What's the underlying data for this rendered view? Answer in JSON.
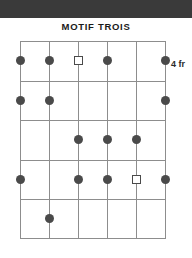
{
  "header": {
    "band_color": "#3a3a3a"
  },
  "title": "MOTIF TROIS",
  "fret_label": "4 fr",
  "chart_data": {
    "type": "table",
    "title": "MOTIF TROIS",
    "subtitle": "",
    "xlabel": "strings",
    "ylabel": "frets",
    "grid": true,
    "strings": 6,
    "frets": 5,
    "starting_fret": 4,
    "starting_fret_label": "4 fr",
    "string_x": [
      0,
      29,
      58,
      87,
      116,
      145
    ],
    "fret_y": [
      0,
      39.5,
      79,
      118.5,
      158,
      197
    ],
    "marker_colors": {
      "filled": "#4a4a4a",
      "open": "#ffffff",
      "outline": "#4a4a4a",
      "grid_line": "#8d8d8d"
    },
    "categories": [
      "string 1",
      "string 2",
      "string 3",
      "string 4",
      "string 5",
      "string 6"
    ],
    "series": [
      {
        "name": "fret 4 (row 1)",
        "values": [
          "dot",
          "dot",
          "square",
          "dot",
          "",
          "dot"
        ]
      },
      {
        "name": "fret 5 (row 2)",
        "values": [
          "dot",
          "dot",
          "",
          "",
          "",
          "dot"
        ]
      },
      {
        "name": "fret 6 (row 3)",
        "values": [
          "",
          "",
          "dot",
          "dot",
          "dot",
          ""
        ]
      },
      {
        "name": "fret 7 (row 4)",
        "values": [
          "dot",
          "",
          "dot",
          "dot",
          "square",
          "dot"
        ]
      },
      {
        "name": "fret 8 (row 5)",
        "values": [
          "",
          "dot",
          "",
          "",
          "",
          ""
        ]
      }
    ],
    "markers": [
      {
        "string": 1,
        "fret_row": 1,
        "shape": "dot",
        "cx": 0,
        "cy": 19.5
      },
      {
        "string": 2,
        "fret_row": 1,
        "shape": "dot",
        "cx": 29,
        "cy": 19.5
      },
      {
        "string": 3,
        "fret_row": 1,
        "shape": "square",
        "cx": 58,
        "cy": 19.5
      },
      {
        "string": 4,
        "fret_row": 1,
        "shape": "dot",
        "cx": 87,
        "cy": 19.5
      },
      {
        "string": 6,
        "fret_row": 1,
        "shape": "dot",
        "cx": 145,
        "cy": 19.5
      },
      {
        "string": 1,
        "fret_row": 2,
        "shape": "dot",
        "cx": 0,
        "cy": 59
      },
      {
        "string": 2,
        "fret_row": 2,
        "shape": "dot",
        "cx": 29,
        "cy": 59
      },
      {
        "string": 6,
        "fret_row": 2,
        "shape": "dot",
        "cx": 145,
        "cy": 59
      },
      {
        "string": 3,
        "fret_row": 3,
        "shape": "dot",
        "cx": 58,
        "cy": 98.5
      },
      {
        "string": 4,
        "fret_row": 3,
        "shape": "dot",
        "cx": 87,
        "cy": 98.5
      },
      {
        "string": 5,
        "fret_row": 3,
        "shape": "dot",
        "cx": 116,
        "cy": 98.5
      },
      {
        "string": 1,
        "fret_row": 4,
        "shape": "dot",
        "cx": 0,
        "cy": 138
      },
      {
        "string": 3,
        "fret_row": 4,
        "shape": "dot",
        "cx": 58,
        "cy": 138
      },
      {
        "string": 4,
        "fret_row": 4,
        "shape": "dot",
        "cx": 87,
        "cy": 138
      },
      {
        "string": 5,
        "fret_row": 4,
        "shape": "square",
        "cx": 116,
        "cy": 138
      },
      {
        "string": 6,
        "fret_row": 4,
        "shape": "dot",
        "cx": 145,
        "cy": 138
      },
      {
        "string": 2,
        "fret_row": 5,
        "shape": "dot",
        "cx": 29,
        "cy": 177.5
      }
    ]
  }
}
